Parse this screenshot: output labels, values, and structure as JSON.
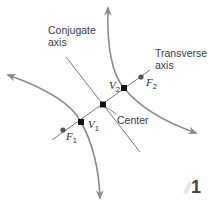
{
  "diagram": {
    "type": "hyperbola",
    "labels": {
      "conjugate_axis": [
        "Conjugate",
        "axis"
      ],
      "transverse_axis": [
        "Transverse",
        "axis"
      ],
      "center": "Center",
      "v1": "V",
      "v1_sub": "1",
      "v2": "V",
      "v2_sub": "2",
      "f1": "F",
      "f1_sub": "1",
      "f2": "F",
      "f2_sub": "2"
    },
    "figure_number": "1",
    "colors": {
      "curve": "#8a8a8a",
      "axis": "#6a6a6a",
      "vertex": "#111111",
      "focus": "#555555",
      "badge": "#e6e6e6"
    }
  }
}
